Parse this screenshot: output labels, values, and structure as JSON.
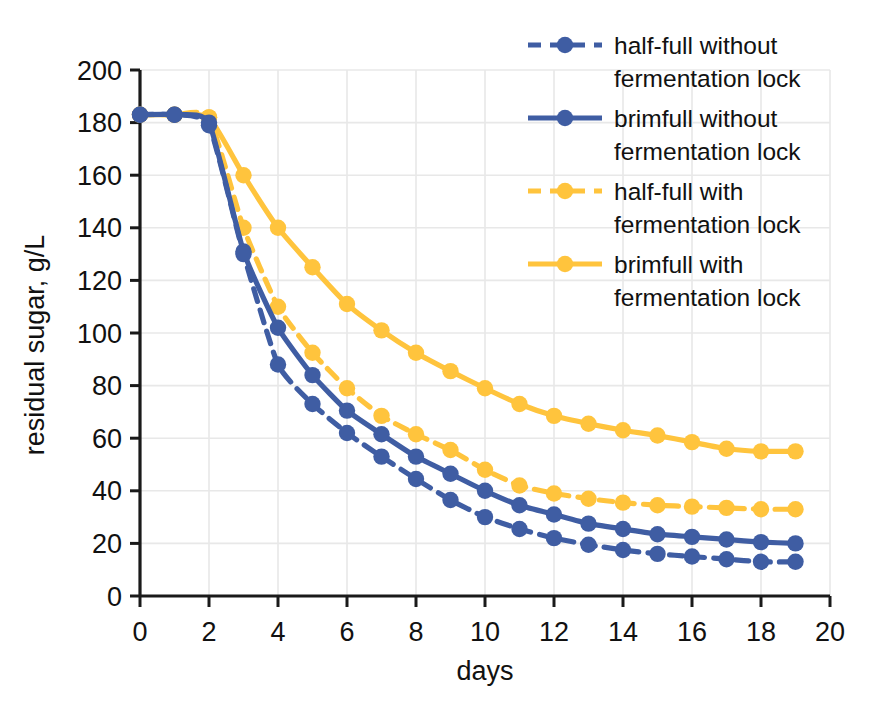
{
  "chart_data": {
    "type": "line",
    "title": "",
    "xlabel": "days",
    "ylabel": "residual sugar, g/L",
    "xlim": [
      0,
      20
    ],
    "ylim": [
      0,
      200
    ],
    "xticks": [
      0,
      2,
      4,
      6,
      8,
      10,
      12,
      14,
      16,
      18,
      20
    ],
    "yticks": [
      0,
      20,
      40,
      60,
      80,
      100,
      120,
      140,
      160,
      180,
      200
    ],
    "grid": true,
    "legend_position": "top-right",
    "x": [
      0,
      1,
      2,
      3,
      4,
      5,
      6,
      7,
      8,
      9,
      10,
      11,
      12,
      13,
      14,
      15,
      16,
      17,
      18,
      19
    ],
    "series": [
      {
        "name": "half-full without fermentation lock",
        "color": "#3F5DA3",
        "style": "dashed",
        "marker": "circle",
        "values": [
          183,
          183,
          179,
          130,
          88,
          73,
          62,
          53,
          44.5,
          36.5,
          30,
          25.5,
          22,
          19.5,
          17.5,
          16,
          15,
          14,
          13,
          13
        ]
      },
      {
        "name": "brimfull without fermentation lock",
        "color": "#3F5DA3",
        "style": "solid",
        "marker": "circle",
        "values": [
          183,
          183,
          180,
          131,
          102,
          84,
          70.5,
          61.5,
          53,
          46.5,
          40,
          34.5,
          31,
          27.5,
          25.5,
          23.5,
          22.5,
          21.5,
          20.5,
          20
        ]
      },
      {
        "name": "half-full with fermentation lock",
        "color": "#FFC43D",
        "style": "dashed",
        "marker": "circle",
        "values": [
          183,
          183,
          182,
          140,
          110,
          92.5,
          79,
          68.5,
          61.5,
          55.5,
          48,
          42,
          39,
          37,
          35.5,
          34.5,
          34,
          33.5,
          33,
          33
        ]
      },
      {
        "name": "brimfull with fermentation lock",
        "color": "#FFC43D",
        "style": "solid",
        "marker": "circle",
        "values": [
          183,
          183,
          182,
          160,
          140,
          125,
          111,
          101,
          92.5,
          85.5,
          79,
          73,
          68.5,
          65.5,
          63,
          61,
          58.5,
          56,
          55,
          55
        ]
      }
    ]
  },
  "axes": {
    "y_label": "residual sugar, g/L",
    "x_label": "days",
    "y_tick_labels": [
      "200",
      "180",
      "160",
      "140",
      "120",
      "100",
      "80",
      "60",
      "40",
      "20",
      "0"
    ],
    "x_tick_labels": [
      "0",
      "2",
      "4",
      "6",
      "8",
      "10",
      "12",
      "14",
      "16",
      "18",
      "20"
    ]
  },
  "legend": {
    "items": [
      {
        "line1": "half-full without",
        "line2": "fermentation lock",
        "color": "#3F5DA3",
        "style": "dashed"
      },
      {
        "line1": "brimfull without",
        "line2": "fermentation lock",
        "color": "#3F5DA3",
        "style": "solid"
      },
      {
        "line1": "half-full with",
        "line2": "fermentation lock",
        "color": "#FFC43D",
        "style": "dashed"
      },
      {
        "line1": "brimfull with",
        "line2": "fermentation lock",
        "color": "#FFC43D",
        "style": "solid"
      }
    ]
  }
}
